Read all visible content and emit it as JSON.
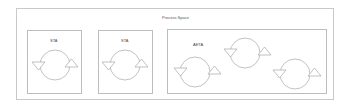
{
  "diagram": {
    "title": "Process Space",
    "boxes": [
      {
        "label": "STA",
        "x": 27,
        "y": 30,
        "w": 55,
        "h": 64
      },
      {
        "label": "STA",
        "x": 98,
        "y": 30,
        "w": 55,
        "h": 64
      },
      {
        "label": "AETA",
        "x": 167,
        "y": 29,
        "w": 160,
        "h": 65
      }
    ],
    "loops": [
      {
        "box": 0,
        "cx": 55,
        "cy": 65,
        "r": 15
      },
      {
        "box": 1,
        "cx": 125,
        "cy": 65,
        "r": 15
      },
      {
        "box": 2,
        "cx": 195,
        "cy": 72,
        "r": 15
      },
      {
        "box": 2,
        "cx": 245,
        "cy": 53,
        "r": 15
      },
      {
        "box": 2,
        "cx": 295,
        "cy": 74,
        "r": 15
      }
    ],
    "colors": {
      "line": "#a8a8a8",
      "box": "#bdbdbd",
      "text": "#444444"
    }
  }
}
